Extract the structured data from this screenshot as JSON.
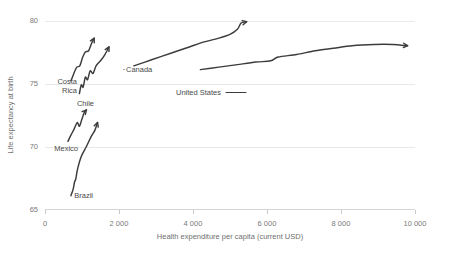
{
  "chart_data": {
    "type": "line",
    "title": "",
    "subtitle": "",
    "xlabel": "Health expenditure per capita (current USD)",
    "ylabel": "Life expectancy at birth",
    "xlim": [
      0,
      10000
    ],
    "ylim": [
      65,
      80
    ],
    "xticks": [
      0,
      2000,
      4000,
      6000,
      8000,
      10000
    ],
    "xticklabels": [
      "0",
      "2 000",
      "4 000",
      "6 000",
      "8 000",
      "10 000"
    ],
    "yticks": [
      65,
      70,
      75,
      80
    ],
    "yticklabels": [
      "65",
      "70",
      "75",
      "80"
    ],
    "grid": "horizontal",
    "legend": "none",
    "annotation_style": "inline-series-labels-with-arrow-ends",
    "series": [
      {
        "name": "Brazil",
        "label": "Brazil",
        "points": [
          [
            700,
            66.1
          ],
          [
            760,
            66.6
          ],
          [
            800,
            67.2
          ],
          [
            830,
            67.4
          ],
          [
            880,
            68.2
          ],
          [
            980,
            69.2
          ],
          [
            1120,
            70.0
          ],
          [
            1250,
            70.8
          ],
          [
            1350,
            71.3
          ],
          [
            1420,
            71.9
          ]
        ]
      },
      {
        "name": "Mexico",
        "label": "Mexico",
        "points": [
          [
            620,
            70.4
          ],
          [
            700,
            70.9
          ],
          [
            790,
            71.4
          ],
          [
            870,
            71.9
          ],
          [
            930,
            71.6
          ],
          [
            990,
            72.1
          ],
          [
            1060,
            72.7
          ],
          [
            1120,
            72.9
          ]
        ]
      },
      {
        "name": "Chile",
        "label": "Chile",
        "points": [
          [
            930,
            74.2
          ],
          [
            980,
            74.9
          ],
          [
            1030,
            74.7
          ],
          [
            1090,
            75.5
          ],
          [
            1150,
            75.3
          ],
          [
            1220,
            76.0
          ],
          [
            1300,
            75.8
          ],
          [
            1380,
            76.4
          ],
          [
            1500,
            76.8
          ],
          [
            1620,
            77.3
          ],
          [
            1730,
            77.9
          ]
        ]
      },
      {
        "name": "Costa Rica",
        "label": "Costa Rica",
        "points": [
          [
            700,
            75.2
          ],
          [
            780,
            75.8
          ],
          [
            860,
            76.3
          ],
          [
            940,
            76.4
          ],
          [
            1020,
            77.1
          ],
          [
            1090,
            77.5
          ],
          [
            1180,
            77.6
          ],
          [
            1260,
            78.2
          ],
          [
            1330,
            78.6
          ]
        ]
      },
      {
        "name": "Canada",
        "label": "Canada",
        "points": [
          [
            2400,
            76.4
          ],
          [
            2900,
            76.9
          ],
          [
            3400,
            77.4
          ],
          [
            3900,
            77.9
          ],
          [
            4300,
            78.3
          ],
          [
            4700,
            78.6
          ],
          [
            5000,
            78.9
          ],
          [
            5200,
            79.3
          ],
          [
            5300,
            79.8
          ],
          [
            5450,
            79.9
          ]
        ]
      },
      {
        "name": "United States",
        "label": "United States",
        "points": [
          [
            4200,
            76.1
          ],
          [
            4700,
            76.3
          ],
          [
            5200,
            76.5
          ],
          [
            5700,
            76.7
          ],
          [
            6100,
            76.8
          ],
          [
            6300,
            77.1
          ],
          [
            6800,
            77.3
          ],
          [
            7300,
            77.6
          ],
          [
            7800,
            77.8
          ],
          [
            8300,
            78.0
          ],
          [
            8900,
            78.1
          ],
          [
            9400,
            78.1
          ],
          [
            9800,
            78.0
          ]
        ]
      }
    ],
    "series_labels": [
      {
        "name": "Brazil",
        "text": "Brazil",
        "x": 93,
        "y": 198,
        "anchor": "end"
      },
      {
        "name": "Mexico",
        "text": "Mexico",
        "x": 78,
        "y": 151,
        "anchor": "end"
      },
      {
        "name": "Chile",
        "text": "Chile",
        "x": 94,
        "y": 106,
        "anchor": "end"
      },
      {
        "name": "Costa Rica",
        "text": "Costa",
        "x": 77,
        "y": 84,
        "anchor": "end"
      },
      {
        "name": "Costa Rica 2",
        "text": "Rica",
        "x": 77,
        "y": 93,
        "anchor": "end"
      },
      {
        "name": "Canada",
        "text": "Canada",
        "x": 126,
        "y": 72,
        "anchor": "start"
      },
      {
        "name": "United States",
        "text": "United States",
        "x": 176,
        "y": 95,
        "anchor": "start"
      }
    ]
  }
}
